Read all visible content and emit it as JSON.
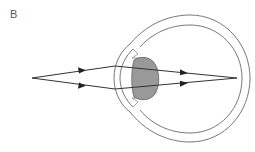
{
  "diagram": {
    "panel_label": "B",
    "colors": {
      "stroke": "#333333",
      "eye_wall": "#555555",
      "lens_fill": "#999999",
      "background": "#ffffff"
    },
    "elements": [
      {
        "id": "object-point",
        "type": "point",
        "x": 32,
        "y": 78
      },
      {
        "id": "upper-ray",
        "type": "ray",
        "points": [
          [
            32,
            78
          ],
          [
            115,
            66
          ],
          [
            237,
            78
          ]
        ]
      },
      {
        "id": "lower-ray",
        "type": "ray",
        "points": [
          [
            32,
            78
          ],
          [
            115,
            89
          ],
          [
            237,
            78
          ]
        ]
      },
      {
        "id": "lens",
        "type": "shape",
        "label": "lens"
      },
      {
        "id": "cornea",
        "type": "shape",
        "label": "cornea"
      },
      {
        "id": "sclera",
        "type": "shape",
        "label": "eyeball wall"
      },
      {
        "id": "focal-point",
        "type": "point",
        "label": "retina focus",
        "x": 237,
        "y": 78
      }
    ]
  }
}
